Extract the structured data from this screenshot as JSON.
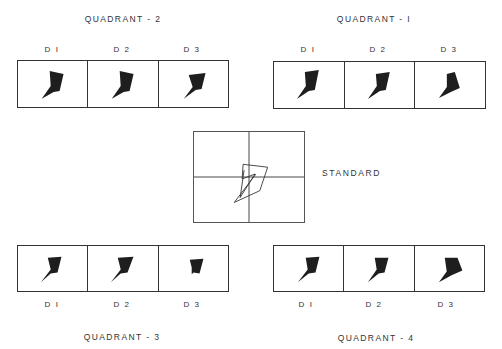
{
  "quadrants": {
    "q2": {
      "title": "QUADRANT - 2",
      "cells": [
        {
          "label": "D I",
          "shape": "shape-a"
        },
        {
          "label": "D 2",
          "shape": "shape-a"
        },
        {
          "label": "D 3",
          "shape": "shape-b"
        }
      ]
    },
    "q1": {
      "title": "QUADRANT - I",
      "cells": [
        {
          "label": "D I",
          "shape": "shape-a"
        },
        {
          "label": "D 2",
          "shape": "shape-a"
        },
        {
          "label": "D 3",
          "shape": "shape-c"
        }
      ]
    },
    "q3": {
      "title": "QUADRANT - 3",
      "cells": [
        {
          "label": "D I",
          "shape": "shape-a"
        },
        {
          "label": "D 2",
          "shape": "shape-a"
        },
        {
          "label": "D 3",
          "shape": "shape-small"
        }
      ]
    },
    "q4": {
      "title": "QUADRANT - 4",
      "cells": [
        {
          "label": "D I",
          "shape": "shape-a"
        },
        {
          "label": "D 2",
          "shape": "shape-a"
        },
        {
          "label": "D 3",
          "shape": "shape-wide"
        }
      ]
    }
  },
  "standard": {
    "label": "STANDARD",
    "description": "outline figure on crosshair grid"
  },
  "colors": {
    "ink": "#1e1e1e",
    "frame": "#333333",
    "background": "#ffffff"
  }
}
